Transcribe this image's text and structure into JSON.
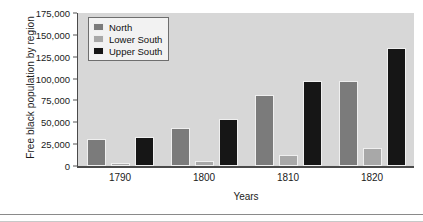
{
  "chart_data": {
    "type": "bar",
    "title": "",
    "xlabel": "Years",
    "ylabel": "Free black population by region",
    "categories": [
      "1790",
      "1800",
      "1810",
      "1820"
    ],
    "series": [
      {
        "name": "North",
        "color": "#7b7b7b",
        "values": [
          31000,
          43000,
          81000,
          97000
        ]
      },
      {
        "name": "Lower South",
        "color": "#a8a8a8",
        "values": [
          4000,
          6000,
          13000,
          21000
        ]
      },
      {
        "name": "Upper South",
        "color": "#161616",
        "values": [
          33000,
          54000,
          97000,
          135000
        ]
      }
    ],
    "ylim": [
      0,
      175000
    ],
    "yticks": [
      "0",
      "25,000",
      "50,000",
      "75,000",
      "100,000",
      "125,000",
      "150,000",
      "175,000"
    ],
    "ytick_values": [
      0,
      25000,
      50000,
      75000,
      100000,
      125000,
      150000,
      175000
    ],
    "grid": false,
    "legend_position": "top-left",
    "plot_background": "#d7d7d7"
  }
}
